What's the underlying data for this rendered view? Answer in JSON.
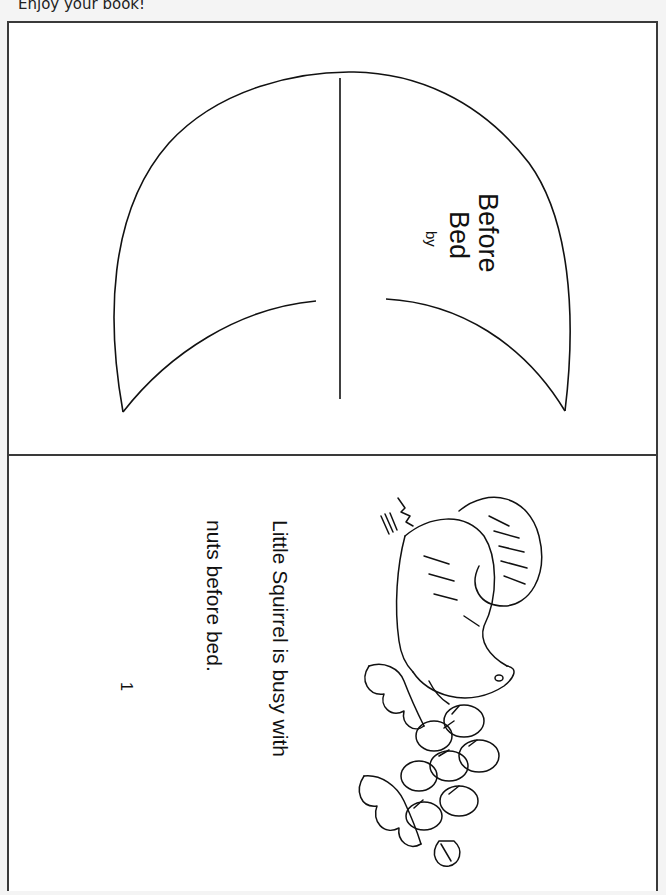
{
  "header": {
    "note": "Enjoy your book!"
  },
  "cover": {
    "title_line1": "Before",
    "title_line2": "Bed",
    "byline": "by",
    "shape": "crescent-moon"
  },
  "page1": {
    "text_line1": "Little Squirrel is busy with",
    "text_line2": "nuts before bed.",
    "page_number": "1",
    "illustration": "squirrel-with-acorns-and-oak-leaves"
  },
  "colors": {
    "background": "#f4f4f4",
    "paper": "#ffffff",
    "ink": "#111111",
    "border": "#3a3a3a"
  }
}
